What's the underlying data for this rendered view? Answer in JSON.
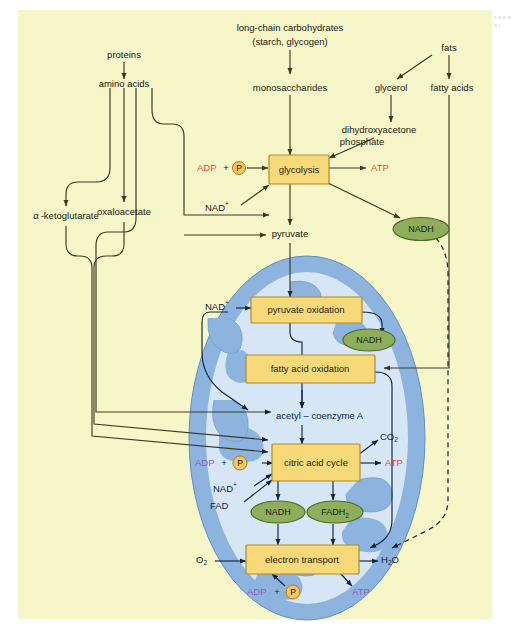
{
  "figure": {
    "type": "biological-pathway-diagram",
    "panel_background": "#f7f6c8",
    "edge_caption_fragment": "c e a a h t"
  },
  "colors": {
    "panel": "#f7f6c8",
    "process_box_fill": "#f7d97a",
    "process_box_stroke": "#b08a1e",
    "carrier_oval_fill": "#8fae5c",
    "carrier_oval_stroke": "#4d6b23",
    "mitochondrion_outer": "#8db4de",
    "mitochondrion_inner": "#d6e6f5",
    "cytosol_line": "#3a3a22",
    "mito_line": "#12243f",
    "atp_red": "#e8463c",
    "adp_purple": "#8a5fbf",
    "phosphate_fill": "#f3c563",
    "phosphate_stroke": "#b07a12"
  },
  "cytosol": {
    "nodes": [
      {
        "id": "proteins",
        "label": "proteins"
      },
      {
        "id": "amino-acids",
        "label": "amino acids"
      },
      {
        "id": "long-chain-carbohydrates",
        "label": "long-chain carbohydrates"
      },
      {
        "id": "starch-glycogen",
        "label": "(starch, glycogen)"
      },
      {
        "id": "monosaccharides",
        "label": "monosaccharides"
      },
      {
        "id": "fats",
        "label": "fats"
      },
      {
        "id": "glycerol",
        "label": "glycerol"
      },
      {
        "id": "fatty-acids",
        "label": "fatty acids"
      },
      {
        "id": "dihydroxyacetone",
        "label": "dihydroxyacetone"
      },
      {
        "id": "phosphate",
        "label": "phosphate"
      },
      {
        "id": "alpha-ketoglutarate",
        "label": "-ketoglutarate",
        "prefix": "α"
      },
      {
        "id": "oxaloacetate",
        "label": "oxaloacetate"
      },
      {
        "id": "pyruvate",
        "label": "pyruvate"
      }
    ],
    "glycolysis_box": {
      "label": "glycolysis"
    },
    "glycolysis_inputs": {
      "adp": "ADP",
      "plus": "+",
      "phosphate_glyph": "P",
      "nad": "NAD",
      "nad_charge": "+"
    },
    "glycolysis_outputs": {
      "atp": "ATP",
      "nadh": "NADH"
    }
  },
  "mitochondrion": {
    "boxes": [
      {
        "id": "pyruvate-oxidation",
        "label": "pyruvate oxidation"
      },
      {
        "id": "fatty-acid-oxidation",
        "label": "fatty acid oxidation"
      },
      {
        "id": "citric-acid-cycle",
        "label": "citric acid cycle"
      },
      {
        "id": "electron-transport",
        "label": "electron transport"
      }
    ],
    "intermediate": {
      "id": "acetyl-coenzyme-a",
      "label": "acetyl – coenzyme A"
    },
    "carriers": [
      {
        "id": "nadh-pyruvate-ox",
        "label": "NADH"
      },
      {
        "id": "nadh-citric",
        "label": "NADH"
      },
      {
        "id": "fadh2-citric",
        "label": "FADH",
        "sub": "2"
      }
    ],
    "inputs": {
      "nad_pyruvate": "NAD",
      "nad_pyruvate_charge": "+",
      "adp_citric": "ADP",
      "plus_citric": "+",
      "phosphate_citric": "P",
      "nad_citric": "NAD",
      "nad_citric_charge": "+",
      "fad_citric": "FAD",
      "oxygen": "O",
      "oxygen_sub": "2",
      "adp_etc": "ADP",
      "plus_etc": "+",
      "phosphate_etc": "P"
    },
    "outputs": {
      "co2": "CO",
      "co2_sub": "2",
      "atp_citric": "ATP",
      "water": "H",
      "water_sub": "2",
      "water_tail": "O",
      "atp_etc": "ATP"
    }
  }
}
